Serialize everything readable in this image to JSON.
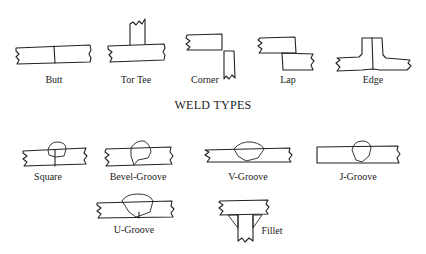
{
  "title": "WELD TYPES",
  "joint_types": [
    {
      "id": "butt",
      "label": "Butt"
    },
    {
      "id": "tee",
      "label": "Tor Tee"
    },
    {
      "id": "corner",
      "label": "Corner"
    },
    {
      "id": "lap",
      "label": "Lap"
    },
    {
      "id": "edge",
      "label": "Edge"
    }
  ],
  "weld_types": [
    {
      "id": "square",
      "label": "Square"
    },
    {
      "id": "bevel-groove",
      "label": "Bevel-Groove"
    },
    {
      "id": "v-groove",
      "label": "V-Groove"
    },
    {
      "id": "j-groove",
      "label": "J-Groove"
    },
    {
      "id": "u-groove",
      "label": "U-Groove"
    },
    {
      "id": "fillet",
      "label": "Fillet"
    }
  ],
  "colors": {
    "ink": "#222222",
    "background": "#ffffff"
  }
}
